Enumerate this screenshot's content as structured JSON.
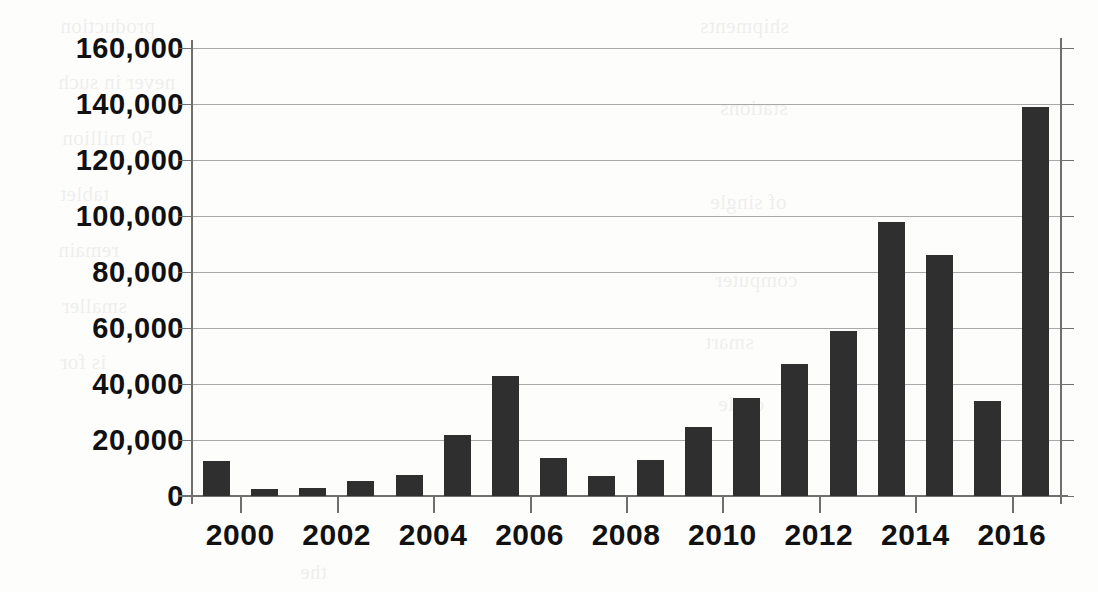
{
  "chart_data": {
    "type": "bar",
    "title": "",
    "subtitle": "",
    "xlabel": "",
    "ylabel": "",
    "categories": [
      "2000",
      "2001",
      "2002",
      "2003",
      "2004",
      "2005",
      "2006",
      "2007",
      "2008",
      "2009",
      "2010",
      "2011",
      "2012",
      "2013",
      "2014",
      "2015",
      "2016",
      "2017"
    ],
    "values": [
      12500,
      2500,
      2800,
      5500,
      7500,
      21800,
      43000,
      13700,
      7000,
      13000,
      24500,
      35000,
      47000,
      59000,
      98000,
      86000,
      34000,
      139000
    ],
    "ylim": [
      0,
      160000
    ],
    "ytick_values": [
      0,
      20000,
      40000,
      60000,
      80000,
      100000,
      120000,
      140000,
      160000
    ],
    "ytick_labels": [
      "0",
      "20,000",
      "40,000",
      "60,000",
      "80,000",
      "100,000",
      "120,000",
      "140,000",
      "160,000"
    ],
    "xtick_labels": [
      "2000",
      "2002",
      "2004",
      "2006",
      "2008",
      "2010",
      "2012",
      "2014",
      "2016"
    ],
    "xtick_categories": [
      "2000",
      "2002",
      "2004",
      "2006",
      "2008",
      "2010",
      "2012",
      "2014",
      "2016"
    ],
    "grid": true,
    "legend": false,
    "bar_color": "#2f2f2f",
    "gridline_color": "#a9a9a9",
    "axis_color": "#6f6f6f",
    "background_color": "#fdfdfc"
  },
  "background_text": {
    "lines": [
      "production",
      "never in such",
      "50 million",
      "tablet",
      "remain",
      "smaller",
      "is for",
      "shipments",
      "stations",
      "of single",
      "computer",
      "smart",
      "cycle",
      "the"
    ]
  }
}
